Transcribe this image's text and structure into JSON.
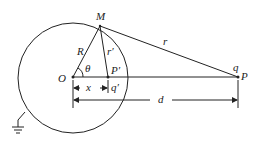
{
  "diagram": {
    "labels": {
      "M": "M",
      "R": "R",
      "r_prime": "r′",
      "r": "r",
      "theta": "θ",
      "O": "O",
      "P_prime": "P′",
      "q": "q",
      "P": "P",
      "x": "x",
      "q_prime": "q′",
      "d": "d"
    },
    "points": {
      "O": [
        73,
        77
      ],
      "M": [
        100,
        26
      ],
      "P_prime": [
        108,
        77
      ],
      "P": [
        238,
        77
      ]
    },
    "circle": {
      "cx": 73,
      "cy": 77,
      "r": 55
    },
    "colors": {
      "stroke": "#222222",
      "background": "#ffffff"
    }
  }
}
